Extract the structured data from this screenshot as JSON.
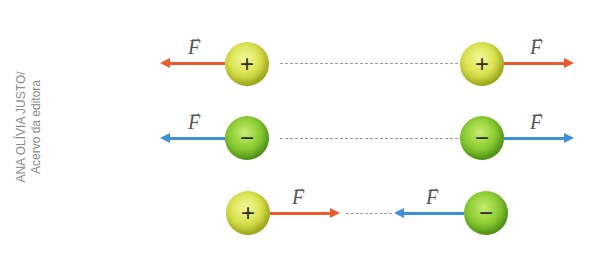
{
  "credit": {
    "line1": "ANA OLÍVIA JUSTO/",
    "line2": "Acervo da editora"
  },
  "labels": {
    "force": "F",
    "vector_arrow": "→",
    "plus": "+",
    "minus": "−"
  },
  "colors": {
    "repulsion_red": "#ea5a2e",
    "negative_blue": "#3d8fd6",
    "positive_sphere": "#dfe65a",
    "negative_sphere": "#95d33a"
  },
  "rows": [
    {
      "name": "two-positive-charges-repel",
      "left": "+",
      "right": "+",
      "interaction": "repulsion"
    },
    {
      "name": "two-negative-charges-repel",
      "left": "−",
      "right": "−",
      "interaction": "repulsion"
    },
    {
      "name": "opposite-charges-attract",
      "left": "+",
      "right": "−",
      "interaction": "attraction"
    }
  ]
}
